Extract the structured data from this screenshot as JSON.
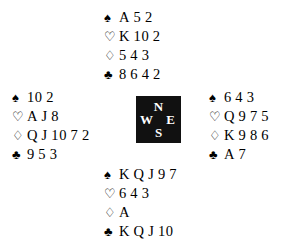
{
  "diagram": {
    "type": "bridge-deal-diagram",
    "background_color": "#ffffff",
    "text_color": "#000000"
  },
  "suits": {
    "spade": {
      "name": "spade-suit-symbol",
      "glyph": "♠",
      "style": "solid"
    },
    "heart": {
      "name": "heart-suit-symbol",
      "glyph": "♡",
      "style": "hollow"
    },
    "diamond": {
      "name": "diamond-suit-symbol",
      "glyph": "♢",
      "style": "hollow"
    },
    "club": {
      "name": "club-suit-symbol",
      "glyph": "♣",
      "style": "solid"
    }
  },
  "compass": {
    "name": "compass-box",
    "background_color": "#111111",
    "label_color": "#ffffff",
    "north": "N",
    "west": "W",
    "east": "E",
    "south": "S"
  },
  "hands": {
    "north": {
      "position": "North",
      "spades": {
        "symbol": "♠",
        "ranks": [
          "A",
          "5",
          "2"
        ]
      },
      "hearts": {
        "symbol": "♡",
        "ranks": [
          "K",
          "10",
          "2"
        ]
      },
      "diamonds": {
        "symbol": "♢",
        "ranks": [
          "5",
          "4",
          "3"
        ]
      },
      "clubs": {
        "symbol": "♣",
        "ranks": [
          "8",
          "6",
          "4",
          "2"
        ]
      }
    },
    "west": {
      "position": "West",
      "spades": {
        "symbol": "♠",
        "ranks": [
          "10",
          "2"
        ]
      },
      "hearts": {
        "symbol": "♡",
        "ranks": [
          "A",
          "J",
          "8"
        ]
      },
      "diamonds": {
        "symbol": "♢",
        "ranks": [
          "Q",
          "J",
          "10",
          "7",
          "2"
        ]
      },
      "clubs": {
        "symbol": "♣",
        "ranks": [
          "9",
          "5",
          "3"
        ]
      }
    },
    "east": {
      "position": "East",
      "spades": {
        "symbol": "♠",
        "ranks": [
          "6",
          "4",
          "3"
        ]
      },
      "hearts": {
        "symbol": "♡",
        "ranks": [
          "Q",
          "9",
          "7",
          "5"
        ]
      },
      "diamonds": {
        "symbol": "♢",
        "ranks": [
          "K",
          "9",
          "8",
          "6"
        ]
      },
      "clubs": {
        "symbol": "♣",
        "ranks": [
          "A",
          "7"
        ]
      }
    },
    "south": {
      "position": "South",
      "spades": {
        "symbol": "♠",
        "ranks": [
          "K",
          "Q",
          "J",
          "9",
          "7"
        ]
      },
      "hearts": {
        "symbol": "♡",
        "ranks": [
          "6",
          "4",
          "3"
        ]
      },
      "diamonds": {
        "symbol": "♢",
        "ranks": [
          "A"
        ]
      },
      "clubs": {
        "symbol": "♣",
        "ranks": [
          "K",
          "Q",
          "J",
          "10"
        ]
      }
    }
  }
}
